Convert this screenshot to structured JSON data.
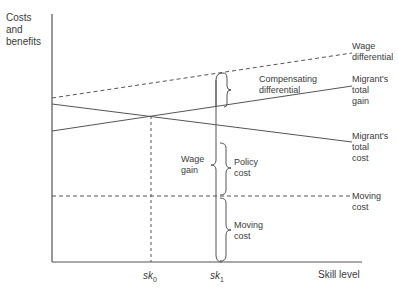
{
  "axes": {
    "y_label": "Costs\nand\nbenefits",
    "x_label": "Skill level"
  },
  "ticks": {
    "sk0": {
      "base": "sk",
      "sub": "0"
    },
    "sk1": {
      "base": "sk",
      "sub": "1"
    }
  },
  "curves": {
    "wage_differential": {
      "label": "Wage\ndifferential",
      "style": "dashed"
    },
    "migrants_total_gain": {
      "label": "Migrant's\ntotal\ngain",
      "style": "solid"
    },
    "migrants_total_cost": {
      "label": "Migrant's\ntotal\ncost",
      "style": "solid"
    },
    "moving_cost_line": {
      "label": "Moving\ncost",
      "style": "dashed"
    }
  },
  "braces": {
    "compensating_differential": "Compensating\ndifferential",
    "wage_gain": "Wage\ngain",
    "policy_cost": "Policy\ncost",
    "moving_cost": "Moving\ncost"
  },
  "colors": {
    "line": "#555555",
    "text": "#3a3a3a"
  }
}
